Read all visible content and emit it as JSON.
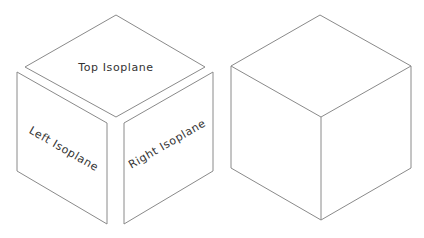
{
  "diagram": {
    "type": "isometric-cube-illustration",
    "exploded_cube": {
      "faces": [
        {
          "id": "top",
          "label": "Top Isoplane"
        },
        {
          "id": "left",
          "label": "Left Isoplane"
        },
        {
          "id": "right",
          "label": "Right Isoplane"
        }
      ]
    },
    "assembled_cube": {
      "label": ""
    },
    "colors": {
      "background": "#ffffff",
      "stroke": "#8a8a8a",
      "text": "#333333"
    }
  }
}
